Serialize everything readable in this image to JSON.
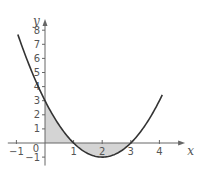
{
  "chart_data": {
    "type": "line",
    "title": "",
    "function": "y = x^2 - 4x + 3",
    "xlabel": "x",
    "ylabel": "y",
    "xlim": [
      -1.3,
      4.9
    ],
    "ylim": [
      -1.6,
      8.8
    ],
    "x_ticks": [
      -1,
      1,
      2,
      3,
      4
    ],
    "x_tick_labels": [
      "−1",
      "1",
      "2",
      "3",
      "4"
    ],
    "y_ticks": [
      -1,
      1,
      2,
      3,
      4,
      5,
      6,
      7,
      8
    ],
    "y_tick_labels": [
      "−1",
      "1",
      "2",
      "3",
      "4",
      "5",
      "6",
      "7",
      "8"
    ],
    "origin_label": "0",
    "grid": false,
    "series": [
      {
        "name": "curve",
        "x_range": [
          -0.95,
          4.1
        ],
        "coefficients": [
          1,
          -4,
          3
        ]
      }
    ],
    "shaded_region": {
      "between": "curve and x-axis",
      "x_from": 0,
      "x_to": 3
    },
    "roots": [
      1,
      3
    ],
    "vertex": [
      2,
      -1
    ],
    "colors": {
      "curve": "#333333",
      "axes": "#666666",
      "shade": "#d4d4d4",
      "text": "#555555"
    }
  }
}
